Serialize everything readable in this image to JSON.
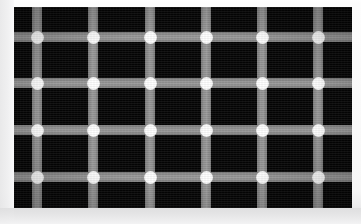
{
  "figure": {
    "name": "scintillating-grid-illusion",
    "caption": "",
    "canvas": {
      "width": 361,
      "height": 224,
      "background_color": "#ffffff"
    },
    "field": {
      "x": 14,
      "y": 7,
      "width": 338,
      "height": 201,
      "background_color": "#050505"
    },
    "line_color": "#8e8e8e",
    "dot_color": "#ffffff",
    "line_thickness": 10,
    "dot_diameter": 13,
    "vertical_line_centers": [
      37,
      93,
      150,
      206,
      262,
      318
    ],
    "horizontal_line_centers": [
      37,
      83,
      130,
      177
    ],
    "column_spacing": 56,
    "row_spacing": 47,
    "dot_count": 24,
    "intersections": [
      {
        "x": 37,
        "y": 37
      },
      {
        "x": 93,
        "y": 37
      },
      {
        "x": 150,
        "y": 37
      },
      {
        "x": 206,
        "y": 37
      },
      {
        "x": 262,
        "y": 37
      },
      {
        "x": 318,
        "y": 37
      },
      {
        "x": 37,
        "y": 83
      },
      {
        "x": 93,
        "y": 83
      },
      {
        "x": 150,
        "y": 83
      },
      {
        "x": 206,
        "y": 83
      },
      {
        "x": 262,
        "y": 83
      },
      {
        "x": 318,
        "y": 83
      },
      {
        "x": 37,
        "y": 130
      },
      {
        "x": 93,
        "y": 130
      },
      {
        "x": 150,
        "y": 130
      },
      {
        "x": 206,
        "y": 130
      },
      {
        "x": 262,
        "y": 130
      },
      {
        "x": 318,
        "y": 130
      },
      {
        "x": 37,
        "y": 177
      },
      {
        "x": 93,
        "y": 177
      },
      {
        "x": 150,
        "y": 177
      },
      {
        "x": 206,
        "y": 177
      },
      {
        "x": 262,
        "y": 177
      },
      {
        "x": 318,
        "y": 177
      }
    ],
    "margins": {
      "left_strip_color": "#e9e9ea",
      "bottom_strip_color": "#e3e3e4"
    }
  }
}
